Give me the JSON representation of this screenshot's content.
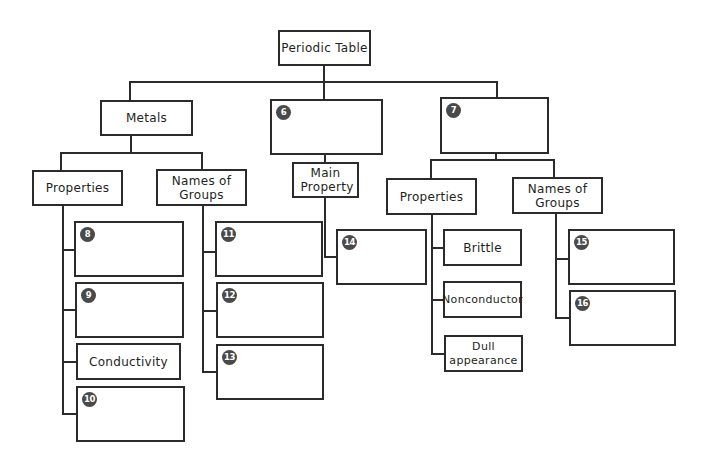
{
  "diagram": {
    "title": "Periodic Table",
    "branches": [
      {
        "label": "Metals",
        "children": [
          {
            "label": "Properties",
            "items": [
              {
                "number": "8",
                "text": ""
              },
              {
                "number": "9",
                "text": ""
              },
              {
                "number": "",
                "text": "Conductivity"
              },
              {
                "number": "10",
                "text": ""
              }
            ]
          },
          {
            "label": "Names of Groups",
            "items": [
              {
                "number": "11",
                "text": ""
              },
              {
                "number": "12",
                "text": ""
              },
              {
                "number": "13",
                "text": ""
              }
            ]
          }
        ]
      },
      {
        "number": "6",
        "label": "",
        "children": [
          {
            "label": "Main Property",
            "items": [
              {
                "number": "14",
                "text": ""
              }
            ]
          }
        ]
      },
      {
        "number": "7",
        "label": "",
        "children": [
          {
            "label": "Properties",
            "items": [
              {
                "number": "",
                "text": "Brittle"
              },
              {
                "number": "",
                "text": "Nonconductor"
              },
              {
                "number": "",
                "text": "Dull appearance"
              }
            ]
          },
          {
            "label": "Names of Groups",
            "items": [
              {
                "number": "15",
                "text": ""
              },
              {
                "number": "16",
                "text": ""
              }
            ]
          }
        ]
      }
    ]
  },
  "colors": {
    "line": "#2b2b2b",
    "badge": "#4a4a4a",
    "background": "#ffffff"
  }
}
